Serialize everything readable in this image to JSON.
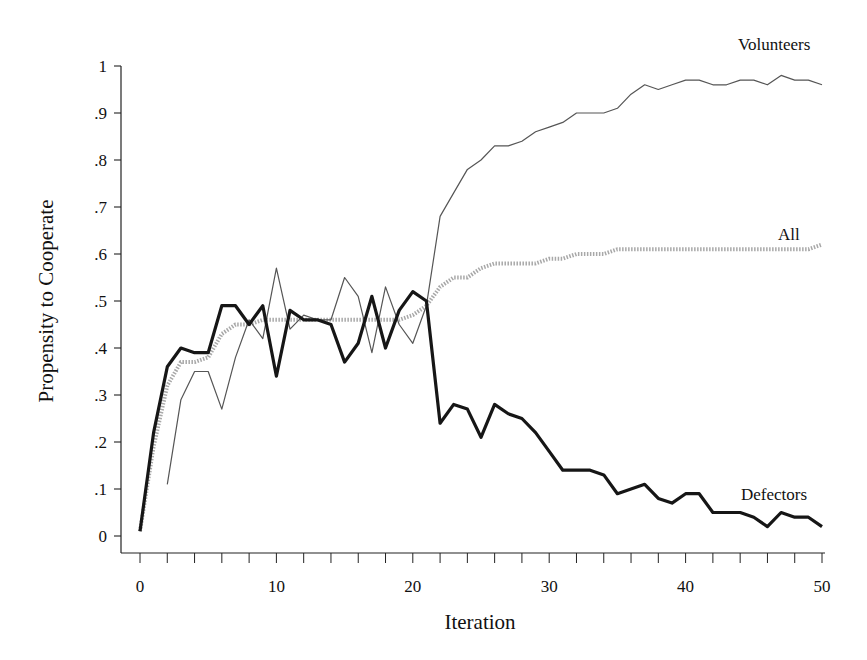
{
  "chart_data": {
    "type": "line",
    "title": "",
    "xlabel": "Iteration",
    "ylabel": "Propensity to Cooperate",
    "xlim": [
      0,
      50
    ],
    "ylim": [
      0,
      1
    ],
    "x_ticks": [
      0,
      10,
      20,
      30,
      40,
      50
    ],
    "x_tick_labels": [
      "0",
      "10",
      "20",
      "30",
      "40",
      "50"
    ],
    "x_minor_tick_step": 2,
    "y_ticks": [
      0,
      0.1,
      0.2,
      0.3,
      0.4,
      0.5,
      0.6,
      0.7,
      0.8,
      0.9,
      1
    ],
    "y_tick_labels": [
      "0",
      ".1",
      ".2",
      ".3",
      ".4",
      ".5",
      ".6",
      ".7",
      ".8",
      ".9",
      "1"
    ],
    "grid": false,
    "legend": "inline labels at right end of each series",
    "series": [
      {
        "name": "Volunteers",
        "style": "thin solid",
        "color": "#555555",
        "x": [
          2,
          3,
          4,
          5,
          6,
          7,
          8,
          9,
          10,
          11,
          12,
          13,
          14,
          15,
          16,
          17,
          18,
          19,
          20,
          21,
          22,
          23,
          24,
          25,
          26,
          27,
          28,
          29,
          30,
          31,
          32,
          33,
          34,
          35,
          36,
          37,
          38,
          39,
          40,
          41,
          42,
          43,
          44,
          45,
          46,
          47,
          48,
          49,
          50
        ],
        "values": [
          0.11,
          0.29,
          0.35,
          0.35,
          0.27,
          0.38,
          0.46,
          0.42,
          0.57,
          0.44,
          0.47,
          0.46,
          0.46,
          0.55,
          0.51,
          0.39,
          0.53,
          0.45,
          0.41,
          0.49,
          0.68,
          0.73,
          0.78,
          0.8,
          0.83,
          0.83,
          0.84,
          0.86,
          0.87,
          0.88,
          0.9,
          0.9,
          0.9,
          0.91,
          0.94,
          0.96,
          0.95,
          0.96,
          0.97,
          0.97,
          0.96,
          0.96,
          0.97,
          0.97,
          0.96,
          0.98,
          0.97,
          0.97,
          0.96
        ]
      },
      {
        "name": "All",
        "style": "dotted gray band",
        "color": "#9a9a9a",
        "x": [
          0,
          1,
          2,
          3,
          4,
          5,
          6,
          7,
          8,
          9,
          10,
          11,
          12,
          13,
          14,
          15,
          16,
          17,
          18,
          19,
          20,
          21,
          22,
          23,
          24,
          25,
          26,
          27,
          28,
          29,
          30,
          31,
          32,
          33,
          34,
          35,
          36,
          37,
          38,
          39,
          40,
          41,
          42,
          43,
          44,
          45,
          46,
          47,
          48,
          49,
          50
        ],
        "values": [
          0.01,
          0.19,
          0.32,
          0.37,
          0.37,
          0.38,
          0.43,
          0.45,
          0.45,
          0.46,
          0.46,
          0.46,
          0.46,
          0.46,
          0.46,
          0.46,
          0.46,
          0.46,
          0.46,
          0.46,
          0.47,
          0.49,
          0.53,
          0.55,
          0.55,
          0.57,
          0.58,
          0.58,
          0.58,
          0.58,
          0.59,
          0.59,
          0.6,
          0.6,
          0.6,
          0.61,
          0.61,
          0.61,
          0.61,
          0.61,
          0.61,
          0.61,
          0.61,
          0.61,
          0.61,
          0.61,
          0.61,
          0.61,
          0.61,
          0.61,
          0.62
        ]
      },
      {
        "name": "Defectors",
        "style": "thick solid",
        "color": "#1a1a1a",
        "x": [
          0,
          1,
          2,
          3,
          4,
          5,
          6,
          7,
          8,
          9,
          10,
          11,
          12,
          13,
          14,
          15,
          16,
          17,
          18,
          19,
          20,
          21,
          22,
          23,
          24,
          25,
          26,
          27,
          28,
          29,
          30,
          31,
          32,
          33,
          34,
          35,
          36,
          37,
          38,
          39,
          40,
          41,
          42,
          43,
          44,
          45,
          46,
          47,
          48,
          49,
          50
        ],
        "values": [
          0.01,
          0.22,
          0.36,
          0.4,
          0.39,
          0.39,
          0.49,
          0.49,
          0.45,
          0.49,
          0.34,
          0.48,
          0.46,
          0.46,
          0.45,
          0.37,
          0.41,
          0.51,
          0.4,
          0.48,
          0.52,
          0.5,
          0.24,
          0.28,
          0.27,
          0.21,
          0.28,
          0.26,
          0.25,
          0.22,
          0.18,
          0.14,
          0.14,
          0.14,
          0.13,
          0.09,
          0.1,
          0.11,
          0.08,
          0.07,
          0.09,
          0.09,
          0.05,
          0.05,
          0.05,
          0.04,
          0.02,
          0.05,
          0.04,
          0.04,
          0.02
        ]
      }
    ],
    "annotations": [
      {
        "text": "Volunteers",
        "near_x": 47,
        "near_y": 1.02
      },
      {
        "text": "All",
        "near_x": 48,
        "near_y": 0.65
      },
      {
        "text": "Defectors",
        "near_x": 46,
        "near_y": 0.09
      }
    ]
  },
  "labels": {
    "xlabel": "Iteration",
    "ylabel": "Propensity to Cooperate",
    "volunteers": "Volunteers",
    "all": "All",
    "defectors": "Defectors"
  }
}
